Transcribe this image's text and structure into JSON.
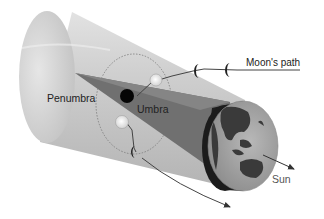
{
  "diagram": {
    "labels": {
      "penumbra": "Penumbra",
      "umbra": "Umbra",
      "moons_path": "Moon's path",
      "sun": "Sun"
    },
    "elements": {
      "earth": "Earth (globe showing Asia and Australia)",
      "penumbra_cone": "light gray cone behind Earth",
      "umbra_cone": "dark gray converging cone",
      "moon_positions": 5,
      "eclipsed_moon": "black moon inside umbra"
    },
    "colors": {
      "penumbra": "#c8c8c8",
      "umbra": "#6e6e6e",
      "earth_day": "#a9a9a9",
      "earth_night": "#1e1e1e",
      "moon_lit": "#f2f2f2",
      "moon_eclipsed": "#050505",
      "path_line": "#444444"
    }
  }
}
